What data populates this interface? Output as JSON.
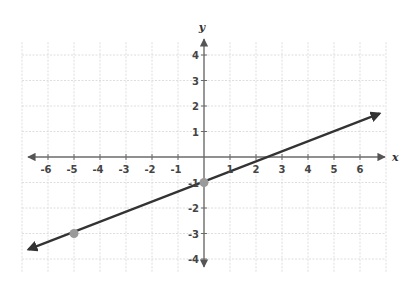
{
  "chart_data": {
    "type": "line",
    "title": "",
    "xlabel": "x",
    "ylabel": "y",
    "xlim": [
      -7,
      7
    ],
    "ylim": [
      -4.5,
      4.5
    ],
    "grid": true,
    "x_ticks": [
      -6,
      -5,
      -4,
      -3,
      -2,
      -1,
      1,
      2,
      3,
      4,
      5,
      6
    ],
    "y_ticks": [
      4,
      3,
      2,
      1,
      -1,
      -2,
      -3,
      -4
    ],
    "x_tick_labels": [
      "-6",
      "-5",
      "-4",
      "-3",
      "-2",
      "-1",
      "1",
      "2",
      "3",
      "4",
      "5",
      "6"
    ],
    "y_tick_labels": [
      "4",
      "3",
      "2",
      "1",
      "-1",
      "-2",
      "-3",
      "-4"
    ],
    "series": [
      {
        "name": "line",
        "equation": "y = 0.4x - 1",
        "slope": 0.4,
        "intercept": -1,
        "x_range": [
          -6.75,
          6.75
        ],
        "arrows": "both",
        "color": "#333333"
      }
    ],
    "points": [
      {
        "x": 0,
        "y": -1,
        "color": "#9a9a9a"
      },
      {
        "x": -5,
        "y": -3,
        "color": "#9a9a9a"
      }
    ],
    "colors": {
      "axis": "#6b6b6b",
      "grid": "#d6d6d6",
      "line": "#333333",
      "point": "#9a9a9a"
    }
  }
}
